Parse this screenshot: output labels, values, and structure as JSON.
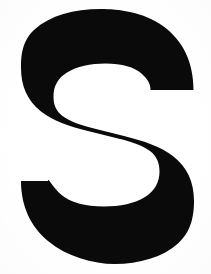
{
  "image": {
    "kind": "scanned-letterform",
    "subject": "letter-s",
    "character": "S",
    "case": "uppercase",
    "script": "latin",
    "style": "bold-sans-serif-grotesque",
    "width_px": 211,
    "height_px": 274,
    "background_color": "#ffffff",
    "foreground_color": "#0a0a0a",
    "alt_text": "A large black bold uppercase letter S on a plain white background"
  },
  "glyph": {
    "label": "S",
    "bounds": {
      "left_px": 21,
      "top_px": 9,
      "right_px": 194,
      "bottom_px": 264,
      "width_px": 173,
      "height_px": 255
    },
    "terminals": {
      "top_right": {
        "cut": "horizontal-flat",
        "y_px": 90,
        "x_from_px": 160,
        "x_to_px": 194
      },
      "bottom_left": {
        "cut": "horizontal-flat",
        "y_px": 181,
        "x_from_px": 21,
        "x_to_px": 48
      }
    },
    "counters": {
      "upper": {
        "left_px": 58,
        "top_px": 38,
        "right_px": 163,
        "bottom_px": 117
      },
      "lower": {
        "left_px": 48,
        "top_px": 155,
        "right_px": 159,
        "bottom_px": 231
      }
    },
    "stroke_thickness_px": 38,
    "outline_path": "M 150.5 90.0 L 193.5 90.0 C 193.5 62.0 183.0 40.5 163.0 26.0 C 143.5 12.0 118.5 9.0 100.5 9.0 C 74.0 9.0 50.0 15.5 34.5 29.5 C 21.5 41.0 21.0 57.5 21.0 68.0 C 21.0 86.0 27.5 101.0 41.0 111.5 C 53.0 121.0 68.0 126.0 90.0 131.5 L 118.0 138.5 C 133.0 142.0 143.5 146.0 150.0 151.0 C 157.0 156.5 159.5 163.0 159.5 171.5 C 159.5 182.5 154.5 191.0 145.0 197.0 C 135.0 203.5 120.0 206.5 104.0 206.5 C 85.0 206.5 70.0 202.5 61.0 194.5 C 52.0 186.5 48.0 177.0 48.0 181.0 L 48.0 181.0 L 21.0 181.0 C 21.0 206.0 30.5 226.5 48.0 241.0 C 66.5 256.5 93.0 264.0 114.5 264.0 C 139.5 264.0 163.0 257.0 178.0 243.5 C 192.0 231.0 194.0 214.0 194.0 201.0 C 194.0 182.0 187.0 167.0 173.5 156.5 C 161.0 146.5 144.0 141.0 124.0 136.0 L 96.0 129.0 C 80.0 125.0 69.0 121.0 62.5 116.0 C 56.0 111.0 53.5 105.0 53.5 96.5 C 53.5 86.0 58.0 78.0 67.0 72.5 C 76.5 66.5 90.5 63.5 105.5 63.5 C 122.0 63.5 134.5 67.0 142.0 74.0 C 148.5 80.0 150.5 84.5 150.5 90.0 Z"
  },
  "colors": {
    "ink": "#0a0a0a",
    "paper": "#ffffff"
  }
}
